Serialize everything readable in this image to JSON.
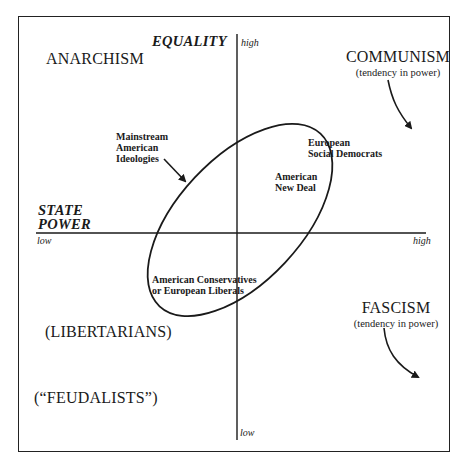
{
  "diagram": {
    "axes": {
      "vertical": {
        "title": "EQUALITY",
        "high_label": "high",
        "low_label": "low"
      },
      "horizontal": {
        "title_line1": "STATE",
        "title_line2": "POWER",
        "low_label": "low",
        "high_label": "high"
      }
    },
    "quadrant_labels": {
      "anarchism": "ANARCHISM",
      "communism": "COMMUNISM",
      "communism_note": "(tendency in power)",
      "fascism": "FASCISM",
      "fascism_note": "(tendency in power)",
      "libertarians": "(LIBERTARIANS)",
      "feudalists": "(“FEUDALISTS”)"
    },
    "ellipse_labels": {
      "mainstream": [
        "Mainstream",
        "American",
        "Ideologies"
      ],
      "european_social_democrats": [
        "European",
        "Social Democrats"
      ],
      "american_new_deal": [
        "American",
        "New Deal"
      ],
      "american_conservatives": [
        "American Conservatives",
        "or European Liberals"
      ]
    },
    "colors": {
      "ink": "#1a1a1a",
      "background": "#ffffff"
    }
  }
}
